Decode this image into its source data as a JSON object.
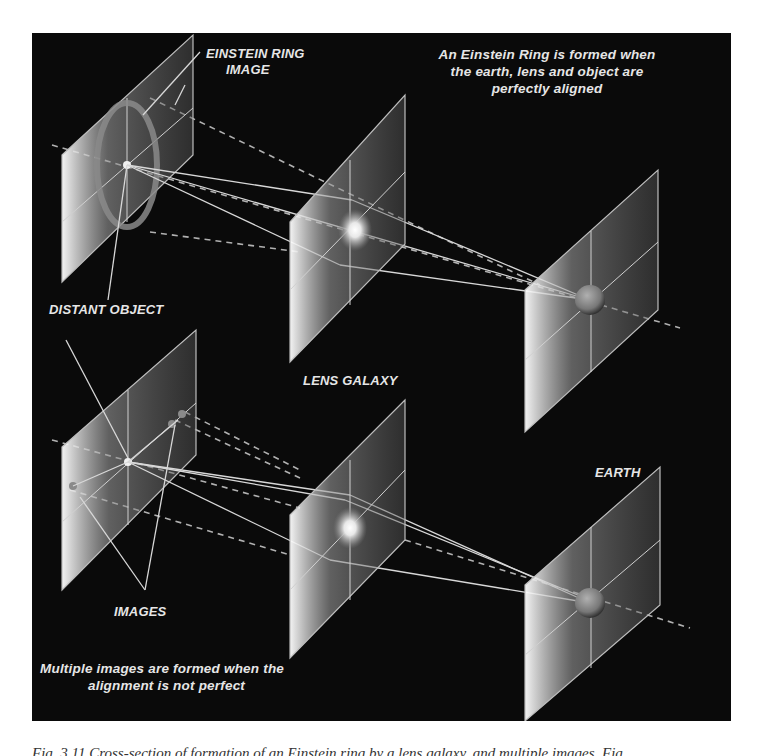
{
  "figure": {
    "background": "#0a0a0a",
    "labels": {
      "einstein_ring_image": [
        "EINSTEIN RING",
        "IMAGE"
      ],
      "distant_object": "DISTANT OBJECT",
      "lens_galaxy": "LENS GALAXY",
      "earth": "EARTH",
      "images": "IMAGES"
    },
    "notes": {
      "top": [
        "An  Einstein Ring is formed when",
        "the earth, lens and object are",
        "perfectly aligned"
      ],
      "bottom": [
        "Multiple images are formed when the",
        "alignment is not perfect"
      ]
    },
    "scenarios": [
      {
        "name": "aligned",
        "planes": [
          "source-plane",
          "lens-plane",
          "observer-plane"
        ],
        "result": "Einstein ring"
      },
      {
        "name": "misaligned",
        "planes": [
          "source-plane",
          "lens-plane",
          "observer-plane"
        ],
        "result": "multiple images"
      }
    ]
  },
  "caption": {
    "text": "Fig. 3.11    Cross-section of formation of an Einstein ring by a lens galaxy, and multiple images. Fig."
  }
}
